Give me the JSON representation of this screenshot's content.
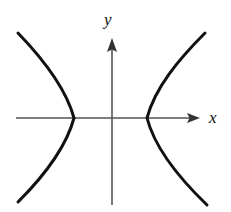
{
  "figure": {
    "background_color": "#ffffff",
    "width": 231,
    "height": 212,
    "axes": {
      "x_axis": {
        "label": "x",
        "color": "#555555",
        "stroke_width": 1.6,
        "start_x": 16,
        "end_x": 200,
        "y": 118,
        "arrow": "right"
      },
      "y_axis": {
        "label": "y",
        "color": "#555555",
        "stroke_width": 1.6,
        "start_y": 205,
        "end_y": 38,
        "x": 112,
        "arrow": "up"
      },
      "origin": {
        "x": 112,
        "y": 118
      }
    },
    "curves": {
      "color": "#111111",
      "stroke_width": 3.0,
      "left_branch": {
        "name": "left-branch",
        "vertex": {
          "x": 74,
          "y": 118
        },
        "top_endpoint": {
          "x": 18,
          "y": 33
        },
        "bottom_endpoint": {
          "x": 18,
          "y": 202
        },
        "path": "M 18 33 C 44 60, 66 88, 74 118 C 66 148, 44 176, 18 202"
      },
      "right_branch": {
        "name": "right-branch",
        "vertex": {
          "x": 147,
          "y": 118
        },
        "top_endpoint": {
          "x": 205,
          "y": 33
        },
        "bottom_endpoint": {
          "x": 207,
          "y": 205
        },
        "path": "M 205 33 C 178 60, 155 88, 147 118 C 155 149, 179 178, 207 205"
      }
    }
  },
  "chart_data": {
    "type": "line",
    "title": "",
    "subtitle": "",
    "xlabel": "x",
    "ylabel": "y",
    "grid": false,
    "legend": "none",
    "annotations": [],
    "xlim": [
      -2.6,
      2.4
    ],
    "ylim": [
      -2.3,
      2.2
    ],
    "xticks": [],
    "yticks": [],
    "equation": "x^2/a^2 - y^2/b^2 = 1",
    "parameters": {
      "a": 1.0,
      "b": 1.05,
      "center": [
        0,
        0
      ]
    },
    "series": [
      {
        "name": "left-branch",
        "x": [
          -2.57,
          -2.3,
          -2.0,
          -1.7,
          -1.45,
          -1.22,
          -1.08,
          -1.0,
          -1.08,
          -1.22,
          -1.45,
          -1.7,
          -2.0,
          -2.3,
          -2.57
        ],
        "y": [
          2.2,
          1.9,
          1.55,
          1.2,
          0.9,
          0.63,
          0.38,
          0.0,
          -0.38,
          -0.63,
          -0.9,
          -1.2,
          -1.55,
          -1.9,
          -2.2
        ]
      },
      {
        "name": "right-branch",
        "x": [
          2.55,
          2.28,
          1.98,
          1.68,
          1.43,
          1.2,
          1.07,
          1.0,
          1.07,
          1.2,
          1.43,
          1.68,
          1.98,
          2.28,
          2.6
        ],
        "y": [
          2.2,
          1.9,
          1.55,
          1.2,
          0.9,
          0.63,
          0.38,
          0.0,
          -0.38,
          -0.63,
          -0.9,
          -1.2,
          -1.55,
          -1.9,
          -2.26
        ]
      }
    ]
  }
}
